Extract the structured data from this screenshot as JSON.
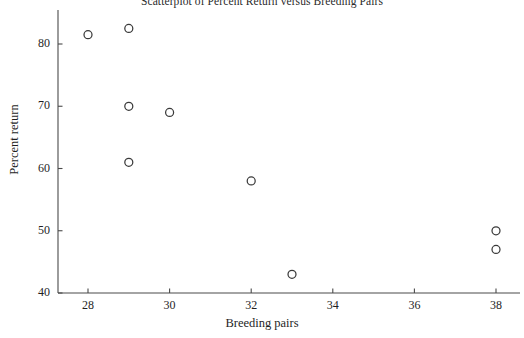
{
  "chart_data": {
    "type": "scatter",
    "title": "Scatterplot of Percent Return versus Breeding Pairs",
    "xlabel": "Breeding pairs",
    "ylabel": "Percent return",
    "xlim": [
      27.2,
      38.8
    ],
    "ylim": [
      39.0,
      84.0
    ],
    "xticks": [
      28,
      30,
      32,
      34,
      36,
      38
    ],
    "yticks": [
      40,
      50,
      60,
      70,
      80
    ],
    "xtick_labels": [
      "28",
      "30",
      "32",
      "34",
      "36",
      "38"
    ],
    "ytick_labels": [
      "40",
      "50",
      "60",
      "70",
      "80"
    ],
    "grid": false,
    "legend": false,
    "marker": "open-circle",
    "marker_color": "#3a3a3a",
    "series": [
      {
        "name": "Percent return vs breeding pairs",
        "x": [
          28,
          29,
          29,
          29,
          30,
          32,
          33,
          38,
          38
        ],
        "y": [
          81.5,
          82.5,
          70.0,
          61.0,
          69.0,
          58.0,
          43.0,
          50.0,
          47.0
        ]
      }
    ],
    "points": [
      {
        "x": 28,
        "y": 81.5
      },
      {
        "x": 29,
        "y": 82.5
      },
      {
        "x": 29,
        "y": 70.0
      },
      {
        "x": 29,
        "y": 61.0
      },
      {
        "x": 30,
        "y": 69.0
      },
      {
        "x": 32,
        "y": 58.0
      },
      {
        "x": 33,
        "y": 43.0
      },
      {
        "x": 38,
        "y": 50.0
      },
      {
        "x": 38,
        "y": 47.0
      }
    ]
  },
  "axis": {
    "line_color": "#4a4a4a",
    "x_ticks": [
      {
        "label": "28",
        "value": 28
      },
      {
        "label": "30",
        "value": 30
      },
      {
        "label": "32",
        "value": 32
      },
      {
        "label": "34",
        "value": 34
      },
      {
        "label": "36",
        "value": 36
      },
      {
        "label": "38",
        "value": 38
      }
    ],
    "y_ticks": [
      {
        "label": "40",
        "value": 40
      },
      {
        "label": "50",
        "value": 50
      },
      {
        "label": "60",
        "value": 60
      },
      {
        "label": "70",
        "value": 70
      },
      {
        "label": "80",
        "value": 80
      }
    ]
  }
}
